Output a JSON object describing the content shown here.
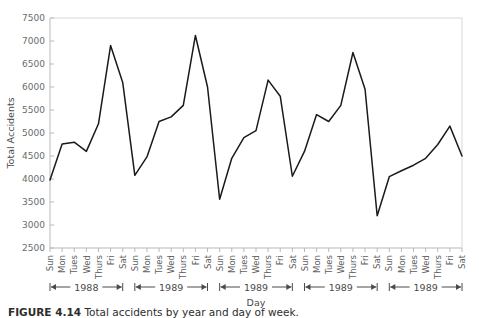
{
  "figure": {
    "caption_label": "FIGURE 4.14",
    "caption_text": "Total accidents by year and day of week."
  },
  "chart_data": {
    "type": "line",
    "title": "",
    "xlabel": "Day",
    "ylabel": "Total Accidents",
    "ylim": [
      2500,
      7500
    ],
    "ytick_step": 500,
    "yticks": [
      2500,
      3000,
      3500,
      4000,
      4500,
      5000,
      5500,
      6000,
      6500,
      7000,
      7500
    ],
    "ytick_labels": [
      "2500",
      "3000",
      "3500",
      "4000",
      "4500",
      "5000",
      "5500",
      "6000",
      "6500",
      "7000",
      "7500"
    ],
    "grid": false,
    "legend": "none",
    "line_color": "#1a1a1a",
    "axis_color": "#b9b9b9",
    "categories": [
      "Sun",
      "Mon",
      "Tues",
      "Wed",
      "Thurs",
      "Fri",
      "Sat",
      "Sun",
      "Mon",
      "Tues",
      "Wed",
      "Thurs",
      "Fri",
      "Sat",
      "Sun",
      "Mon",
      "Tues",
      "Wed",
      "Thurs",
      "Fri",
      "Sat",
      "Sun",
      "Mon",
      "Tues",
      "Wed",
      "Thurs",
      "Fri",
      "Sat",
      "Sun",
      "Mon",
      "Tues",
      "Wed",
      "Thurs",
      "Fri",
      "Sat"
    ],
    "values": [
      3980,
      4760,
      4800,
      4600,
      5200,
      6900,
      6100,
      4080,
      4480,
      5250,
      5350,
      5600,
      7120,
      6000,
      3560,
      4450,
      4900,
      5050,
      6150,
      5800,
      4060,
      4600,
      5400,
      5250,
      5600,
      6750,
      5950,
      3200,
      4050,
      4180,
      4300,
      4450,
      4750,
      5150,
      4500
    ],
    "group_brackets": [
      {
        "label": "1988",
        "start_index": 0,
        "end_index": 6
      },
      {
        "label": "1989",
        "start_index": 7,
        "end_index": 13
      },
      {
        "label": "1989",
        "start_index": 14,
        "end_index": 20
      },
      {
        "label": "1989",
        "start_index": 21,
        "end_index": 27
      },
      {
        "label": "1989",
        "start_index": 28,
        "end_index": 34
      }
    ]
  }
}
